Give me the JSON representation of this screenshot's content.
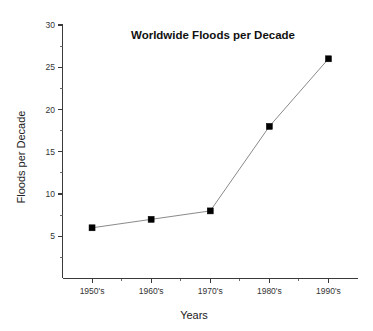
{
  "chart_data": {
    "type": "line",
    "title": "Worldwide Floods per Decade",
    "xlabel": "Years",
    "ylabel": "Floods per Decade",
    "categories": [
      "1950's",
      "1960's",
      "1970's",
      "1980's",
      "1990's"
    ],
    "values": [
      6,
      7,
      8,
      18,
      26
    ],
    "series": [
      {
        "name": "Floods per Decade",
        "values": [
          6,
          7,
          8,
          18,
          26
        ]
      }
    ],
    "ylim": [
      0,
      30
    ],
    "y_major_ticks": [
      5,
      10,
      15,
      20,
      25,
      30
    ],
    "y_minor_ticks": [
      2.5,
      7.5,
      12.5,
      17.5,
      22.5,
      27.5
    ],
    "y_tick_labels": [
      "5",
      "10",
      "15",
      "20",
      "25",
      "30"
    ],
    "grid": false,
    "legend": false,
    "legend_position": "none",
    "marker_style": "filled-square",
    "marker_color": "#000000",
    "line_color": "#8a8a8a",
    "background_color": "#ffffff",
    "axis_color": "#3a3a3a",
    "points": [
      {
        "category": "1950's",
        "value": 6
      },
      {
        "category": "1960's",
        "value": 7
      },
      {
        "category": "1970's",
        "value": 8
      },
      {
        "category": "1980's",
        "value": 18
      },
      {
        "category": "1990's",
        "value": 26
      }
    ]
  }
}
